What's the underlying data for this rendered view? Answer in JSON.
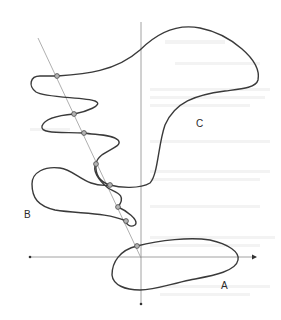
{
  "figure": {
    "labels": {
      "A": "A",
      "B": "B",
      "C": "C"
    },
    "colors": {
      "curve": "#3a3a3a",
      "axis": "#8a8a8a",
      "secant": "#9a9a9a",
      "point_fill": "#b5b5b5",
      "point_stroke": "#4a4a4a"
    },
    "axes": {
      "vertical": {
        "x": 141,
        "y_top": 22,
        "y_bottom": 303
      },
      "horizontal": {
        "y": 257,
        "x_left": 30,
        "x_right": 256
      }
    },
    "secant_line": {
      "from": [
        38,
        38
      ],
      "to": [
        141,
        258
      ]
    },
    "intersection_points": [
      [
        57,
        76
      ],
      [
        74,
        114
      ],
      [
        84,
        133
      ],
      [
        96,
        164
      ],
      [
        110,
        185
      ],
      [
        118,
        207
      ],
      [
        126,
        221
      ],
      [
        137,
        246
      ]
    ]
  }
}
